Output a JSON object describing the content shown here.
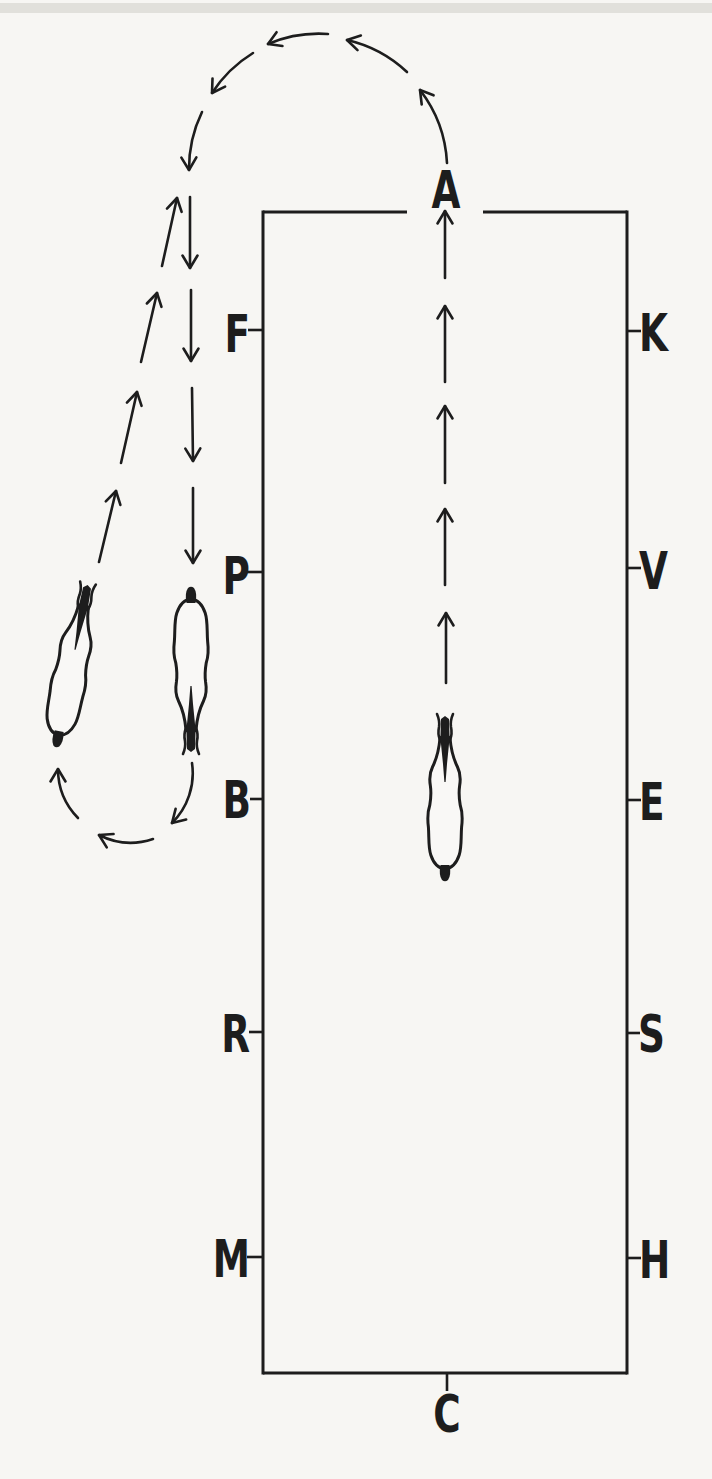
{
  "diagram": {
    "markers": {
      "top": "A",
      "bottom": "C",
      "left": [
        "F",
        "P",
        "B",
        "R",
        "M"
      ],
      "right": [
        "K",
        "V",
        "E",
        "S",
        "H"
      ]
    },
    "figures": {
      "horse_centerline": "horse-and-rider-top-view-riding-up-centerline-toward-A",
      "horse_outside_down": "horse-and-rider-top-view-riding-down-outside-the-arena",
      "horse_outside_return": "horse-and-rider-top-view-returning-upward-after-half-turn"
    },
    "flow": {
      "centerline": "dashed arrows up the centerline to A",
      "exit_arc": "half-circle of dashed curved arrows leaving A to the left",
      "outside_down": "dashed arrows descending outside the left wall",
      "half_volte": "curved arrows turning left at the bottom",
      "return_up": "slanted dashed arrows climbing back up"
    },
    "colors": {
      "ink": "#1d1d1d",
      "paper": "#f7f6f3",
      "scan_edge": "#d9d8d3"
    }
  }
}
